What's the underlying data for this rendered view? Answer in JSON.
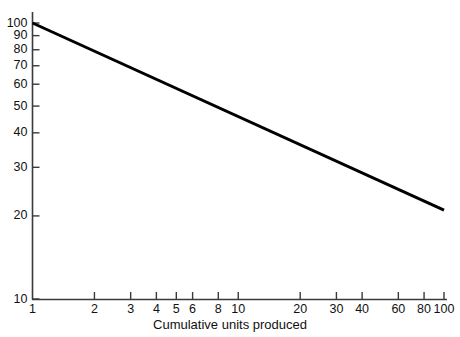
{
  "chart_data": {
    "type": "line",
    "title": "",
    "subtitle": "",
    "xlabel": "Cumulative units produced",
    "ylabel": "",
    "xscale": "log",
    "yscale": "log",
    "xlim": [
      1,
      100
    ],
    "ylim": [
      10,
      100
    ],
    "grid": false,
    "legend": null,
    "xticks": [
      {
        "value": 1,
        "label": "1"
      },
      {
        "value": 2,
        "label": "2"
      },
      {
        "value": 3,
        "label": "3"
      },
      {
        "value": 4,
        "label": "4"
      },
      {
        "value": 5,
        "label": "5"
      },
      {
        "value": 6,
        "label": "6"
      },
      {
        "value": 8,
        "label": "8"
      },
      {
        "value": 10,
        "label": "10"
      },
      {
        "value": 20,
        "label": "20"
      },
      {
        "value": 30,
        "label": "30"
      },
      {
        "value": 40,
        "label": "40"
      },
      {
        "value": 60,
        "label": "60"
      },
      {
        "value": 80,
        "label": "80"
      },
      {
        "value": 100,
        "label": "100"
      }
    ],
    "yticks": [
      {
        "value": 100,
        "label": "100"
      },
      {
        "value": 90,
        "label": "90"
      },
      {
        "value": 80,
        "label": "80"
      },
      {
        "value": 70,
        "label": "70"
      },
      {
        "value": 60,
        "label": "60"
      },
      {
        "value": 50,
        "label": "50"
      },
      {
        "value": 40,
        "label": "40"
      },
      {
        "value": 30,
        "label": "30"
      },
      {
        "value": 20,
        "label": "20"
      },
      {
        "value": 10,
        "label": "10"
      }
    ],
    "series": [
      {
        "name": "learning-curve",
        "color": "#000000",
        "width": 3,
        "x": [
          1,
          100
        ],
        "y": [
          100,
          21
        ]
      }
    ],
    "annotations": []
  },
  "axes": {
    "line_color": "#3a3a3a",
    "tick_color": "#3a3a3a"
  }
}
